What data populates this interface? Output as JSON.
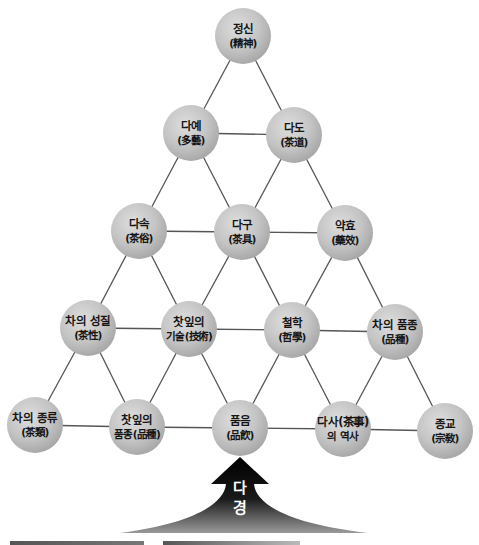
{
  "diagram": {
    "nodes": [
      {
        "id": "jeongsin",
        "line1": "정신",
        "line2": "(精神)"
      },
      {
        "id": "daye",
        "line1": "다예",
        "line2": "(多藝)"
      },
      {
        "id": "dado",
        "line1": "다도",
        "line2": "(茶道)"
      },
      {
        "id": "dasok",
        "line1": "다속",
        "line2": "(茶俗)"
      },
      {
        "id": "dagu",
        "line1": "다구",
        "line2": "(茶具)"
      },
      {
        "id": "yakhyo",
        "line1": "약효",
        "line2": "(藥效)"
      },
      {
        "id": "cha-seongjil",
        "line1": "차의 성질",
        "line2": "(茶性)"
      },
      {
        "id": "chatip-gisul",
        "line1": "찻잎의",
        "line2": "기술(技術)"
      },
      {
        "id": "cheolhak",
        "line1": "철학",
        "line2": "(哲學)"
      },
      {
        "id": "cha-pumjong",
        "line1": "차의 품종",
        "line2": "(品種)"
      },
      {
        "id": "cha-jongryu",
        "line1": "차의 종류",
        "line2": "(茶類)"
      },
      {
        "id": "chatip-pumjong",
        "line1": "찻잎의",
        "line2": "품종(品種)"
      },
      {
        "id": "pumeum",
        "line1": "품음",
        "line2": "(品飮)"
      },
      {
        "id": "dasa-yeoksa",
        "line1": "다사(茶事)",
        "line2": "의 역사"
      },
      {
        "id": "jonggyo",
        "line1": "종교",
        "line2": "(宗敎)"
      }
    ],
    "edges": [
      [
        "jeongsin",
        "daye"
      ],
      [
        "jeongsin",
        "dado"
      ],
      [
        "daye",
        "dado"
      ],
      [
        "daye",
        "dasok"
      ],
      [
        "daye",
        "dagu"
      ],
      [
        "dado",
        "dagu"
      ],
      [
        "dado",
        "yakhyo"
      ],
      [
        "dasok",
        "dagu"
      ],
      [
        "dagu",
        "yakhyo"
      ],
      [
        "dasok",
        "cha-seongjil"
      ],
      [
        "dasok",
        "chatip-gisul"
      ],
      [
        "dagu",
        "chatip-gisul"
      ],
      [
        "dagu",
        "cheolhak"
      ],
      [
        "yakhyo",
        "cheolhak"
      ],
      [
        "yakhyo",
        "cha-pumjong"
      ],
      [
        "cha-seongjil",
        "chatip-gisul"
      ],
      [
        "chatip-gisul",
        "cheolhak"
      ],
      [
        "cheolhak",
        "cha-pumjong"
      ],
      [
        "cha-seongjil",
        "cha-jongryu"
      ],
      [
        "cha-seongjil",
        "chatip-pumjong"
      ],
      [
        "chatip-gisul",
        "chatip-pumjong"
      ],
      [
        "chatip-gisul",
        "pumeum"
      ],
      [
        "cheolhak",
        "pumeum"
      ],
      [
        "cheolhak",
        "dasa-yeoksa"
      ],
      [
        "cha-pumjong",
        "dasa-yeoksa"
      ],
      [
        "cha-pumjong",
        "jonggyo"
      ],
      [
        "cha-jongryu",
        "chatip-pumjong"
      ],
      [
        "chatip-pumjong",
        "pumeum"
      ],
      [
        "pumeum",
        "dasa-yeoksa"
      ],
      [
        "dasa-yeoksa",
        "jonggyo"
      ]
    ],
    "arrow": {
      "line1": "다",
      "line2": "경"
    },
    "colors": {
      "line": "#555555",
      "arrow": "#111111"
    }
  }
}
